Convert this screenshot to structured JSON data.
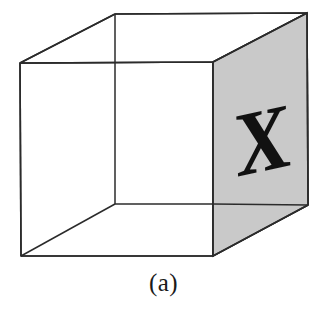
{
  "figure": {
    "name": "wireframe-cube-with-marked-face",
    "caption": "(a)",
    "face_label": "X",
    "colors": {
      "background": "#ffffff",
      "edge_stroke": "#2b2b2b",
      "shaded_face_fill": "#c9c9c9",
      "glyph": "#111111",
      "caption": "#1a1a1a"
    },
    "geometry": {
      "front_right_face": {
        "note": "shaded face bearing the X",
        "points": "213,62 307,13 308,205 213,256"
      },
      "front_left_face": {
        "points": "20,63 213,62 213,256 21,256"
      },
      "top_face": {
        "points": "20,63 115,14 307,13 213,62"
      },
      "hidden_vertical_edge": "115,14 115,204",
      "hidden_bottom_left_edge": "21,256 115,204",
      "hidden_bottom_right_edge": "115,204 308,205",
      "vertices": {
        "front_top_left": "20,63",
        "front_top_right": "213,62",
        "front_bottom_left": "21,256",
        "front_bottom_right": "213,256",
        "back_top_left": "115,14",
        "back_top_right": "307,13",
        "back_bottom_left": "115,204",
        "back_bottom_right": "308,205"
      },
      "glyph_anchor": "262,140",
      "glyph_rotation_deg": -12,
      "glyph_font_size": 86
    }
  }
}
